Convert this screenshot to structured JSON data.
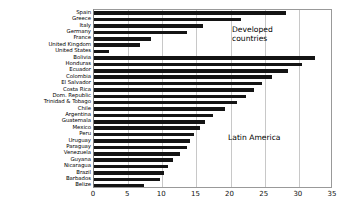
{
  "chart_data": {
    "type": "bar",
    "orientation": "horizontal",
    "title": "",
    "xlabel": "",
    "ylabel": "",
    "xlim": [
      0,
      35
    ],
    "xticks": [
      0,
      5,
      10,
      15,
      20,
      25,
      30,
      35
    ],
    "xtick_labels": [
      "0",
      "5",
      "10",
      "15",
      "20",
      "25",
      "30",
      "35"
    ],
    "grid": true,
    "grid_axis": "x",
    "legend": "none",
    "bar_color": "#141414",
    "categories": [
      "Spain",
      "Greece",
      "Italy",
      "Germany",
      "France",
      "United Kingdom",
      "United States",
      "Bolivia",
      "Honduras",
      "Ecuador",
      "Colombia",
      "El Salvador",
      "Costa Rica",
      "Dom. Republic",
      "Trinidad & Tobago",
      "Chile",
      "Argentina",
      "Guatemala",
      "Mexico",
      "Peru",
      "Uruguay",
      "Paraguay",
      "Venezuela",
      "Guyana",
      "Nicaragua",
      "Brazil",
      "Barbados",
      "Belize"
    ],
    "values": [
      28.1,
      21.5,
      16.0,
      13.6,
      8.3,
      6.8,
      2.2,
      32.3,
      30.5,
      28.4,
      26.0,
      24.6,
      23.4,
      22.3,
      21.0,
      19.2,
      17.4,
      16.3,
      15.5,
      14.7,
      14.1,
      13.6,
      12.6,
      11.6,
      10.9,
      10.3,
      9.6,
      7.3
    ],
    "annotations": [
      {
        "text": "Developed\ncountries",
        "x": 20.5,
        "y_index": 3
      },
      {
        "text": "Latin America",
        "x": 20.0,
        "y_index": 19
      }
    ]
  }
}
